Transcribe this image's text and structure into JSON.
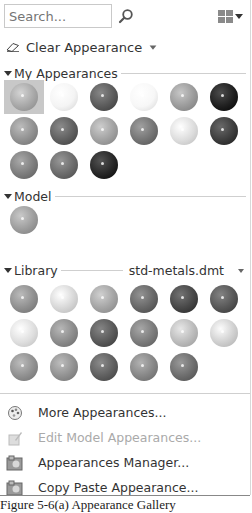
{
  "search": {
    "placeholder": "Search...",
    "value": ""
  },
  "toolbar": {
    "clear_label": "Clear Appearance"
  },
  "sections": {
    "my_appearances": {
      "title": "My Appearances",
      "swatches": [
        {
          "name": "swatch-1",
          "color": "#a7a7a7",
          "selected": true
        },
        {
          "name": "swatch-2",
          "color": "#f4f4f4"
        },
        {
          "name": "swatch-3",
          "color": "#5a5a5a"
        },
        {
          "name": "swatch-4",
          "color": "#f7f7f7"
        },
        {
          "name": "swatch-5",
          "color": "#9a9a9a"
        },
        {
          "name": "swatch-6",
          "color": "#1f1f1f"
        },
        {
          "name": "swatch-7",
          "color": "#8f8f8f"
        },
        {
          "name": "swatch-8",
          "color": "#5e5e5e"
        },
        {
          "name": "swatch-9",
          "color": "#a0a0a0"
        },
        {
          "name": "swatch-10",
          "color": "#737373"
        },
        {
          "name": "swatch-11",
          "color": "#dcdcdc"
        },
        {
          "name": "swatch-12",
          "color": "#3c3c3c"
        },
        {
          "name": "swatch-13",
          "color": "#7c7c7c"
        },
        {
          "name": "swatch-14",
          "color": "#6a6a6a"
        },
        {
          "name": "swatch-15",
          "color": "#262626"
        }
      ]
    },
    "model": {
      "title": "Model",
      "swatches": [
        {
          "name": "model-swatch-1",
          "color": "#9c9c9c"
        }
      ]
    },
    "library": {
      "title": "Library",
      "file": "std-metals.dmt",
      "swatches": [
        {
          "name": "lib-1",
          "color": "#8e8e8e"
        },
        {
          "name": "lib-2",
          "color": "#d6d6d6"
        },
        {
          "name": "lib-3",
          "color": "#a3a3a3"
        },
        {
          "name": "lib-4",
          "color": "#666666"
        },
        {
          "name": "lib-5",
          "color": "#464646"
        },
        {
          "name": "lib-6",
          "color": "#565656"
        },
        {
          "name": "lib-7",
          "color": "#dedede"
        },
        {
          "name": "lib-8",
          "color": "#8a8a8a"
        },
        {
          "name": "lib-9",
          "color": "#585858"
        },
        {
          "name": "lib-10",
          "color": "#7a7a7a"
        },
        {
          "name": "lib-11",
          "color": "#bababa"
        },
        {
          "name": "lib-12",
          "color": "#cfcfcf"
        },
        {
          "name": "lib-13",
          "color": "#8f8f8f"
        },
        {
          "name": "lib-14",
          "color": "#909090"
        },
        {
          "name": "lib-15",
          "color": "#5e5e5e"
        },
        {
          "name": "lib-16",
          "color": "#858585"
        },
        {
          "name": "lib-17",
          "color": "#6c6c6c"
        }
      ]
    }
  },
  "menu": [
    {
      "label": "More Appearances...",
      "icon": "palette-icon",
      "disabled": false
    },
    {
      "label": "Edit Model Appearances...",
      "icon": "edit-appearance-icon",
      "disabled": true
    },
    {
      "label": "Appearances Manager...",
      "icon": "appearance-manager-icon",
      "disabled": false
    },
    {
      "label": "Copy Paste Appearance...",
      "icon": "copy-paste-icon",
      "disabled": false
    }
  ],
  "caption": "Figure 5-6(a) Appearance Gallery"
}
